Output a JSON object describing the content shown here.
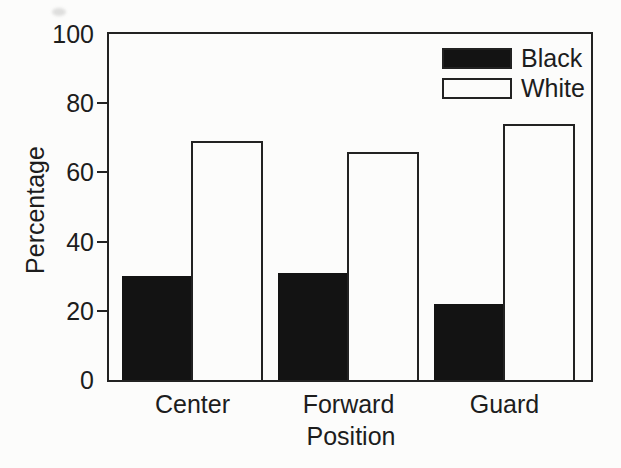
{
  "colors": {
    "ink": "#1d1d1d",
    "paper": "#fcfcfb",
    "bar_black_fill": "#131313",
    "bar_white_fill": "#fcfcfb"
  },
  "chart_data": {
    "type": "bar",
    "title": "",
    "xlabel": "Position",
    "ylabel": "Percentage",
    "categories": [
      "Center",
      "Forward",
      "Guard"
    ],
    "series": [
      {
        "name": "Black",
        "fill": "black",
        "values": [
          30,
          31,
          22
        ]
      },
      {
        "name": "White",
        "fill": "white",
        "values": [
          69,
          66,
          74
        ]
      }
    ],
    "ylim": [
      0,
      100
    ],
    "ytick_labels": [
      0,
      20,
      40,
      60,
      80,
      100
    ],
    "ytick_marks": [
      20,
      40,
      60,
      80
    ],
    "grid": false,
    "legend_position": "top-right-inside"
  }
}
